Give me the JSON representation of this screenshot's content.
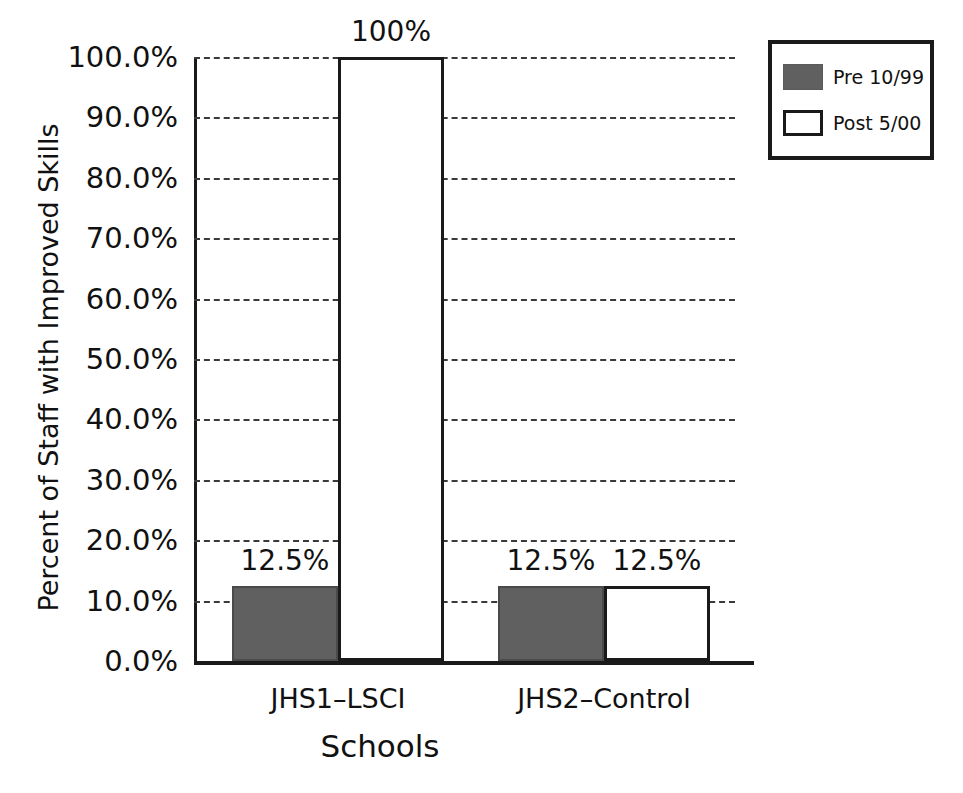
{
  "chart_data": {
    "type": "bar",
    "title": "",
    "xlabel": "Schools",
    "ylabel": "Percent of Staff with Improved Skills",
    "categories": [
      "JHS1–LSCI",
      "JHS2–Control"
    ],
    "series": [
      {
        "name": "Pre 10/99",
        "color": "#606060",
        "values": [
          12.5,
          12.5
        ],
        "value_labels": [
          "12.5%",
          "12.5%"
        ]
      },
      {
        "name": "Post 5/00",
        "color": "#ffffff",
        "values": [
          100,
          12.5
        ],
        "value_labels": [
          "100%",
          "12.5%"
        ]
      }
    ],
    "ylim": [
      0,
      100
    ],
    "ytick_values": [
      0,
      10,
      20,
      30,
      40,
      50,
      60,
      70,
      80,
      90,
      100
    ],
    "ytick_labels": [
      "0.0%",
      "10.0%",
      "20.0%",
      "30.0%",
      "40.0%",
      "50.0%",
      "60.0%",
      "70.0%",
      "80.0%",
      "90.0%",
      "100.0%"
    ],
    "grid": "horizontal-dashed",
    "legend_position": "top-right",
    "legend_entries": [
      "Pre 10/99",
      "Post 5/00"
    ]
  },
  "axes": {
    "y_title": "Percent of Staff with Improved Skills",
    "x_title": "Schools"
  },
  "legend": {
    "items": [
      {
        "label": "Pre 10/99",
        "swatch": "filled-gray"
      },
      {
        "label": "Post 5/00",
        "swatch": "outlined-white"
      }
    ]
  }
}
